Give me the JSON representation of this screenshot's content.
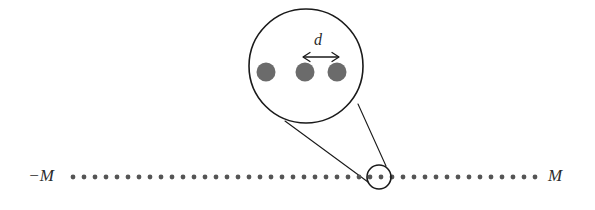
{
  "figure": {
    "labels": {
      "left_end": "−M",
      "right_end": "M",
      "spacing": "d"
    },
    "colors": {
      "lattice_dot": "#555555",
      "inset_dot": "#6b6b6b",
      "stroke": "#1a1a1a",
      "text": "#2b2b2b",
      "background": "#ffffff"
    },
    "lattice": {
      "axis_y": 177,
      "first_dot_x": 73,
      "last_dot_x": 535,
      "dot_count": 43,
      "dot_pitch": 11.0,
      "dot_radius": 2.4,
      "left_label_x": 54,
      "right_label_x": 548
    },
    "magnifier": {
      "center_x": 306,
      "center_y": 66,
      "radius": 57,
      "stroke_width": 1.6,
      "dots": [
        {
          "cx": 266,
          "cy": 72,
          "r": 9.5
        },
        {
          "cx": 305,
          "cy": 72,
          "r": 9.5
        },
        {
          "cx": 337,
          "cy": 72,
          "r": 9.5
        }
      ],
      "arrow": {
        "x1": 303,
        "x2": 339,
        "y": 57
      },
      "label_x": 318,
      "label_y": 45
    },
    "target": {
      "center_x": 379,
      "center_y": 177,
      "radius": 12,
      "stroke_width": 1.6
    },
    "cone": {
      "left_line": {
        "x1": 285,
        "y1": 121,
        "x2": 368,
        "y2": 182
      },
      "right_line": {
        "x1": 358,
        "y1": 104,
        "x2": 386,
        "y2": 166
      }
    }
  }
}
